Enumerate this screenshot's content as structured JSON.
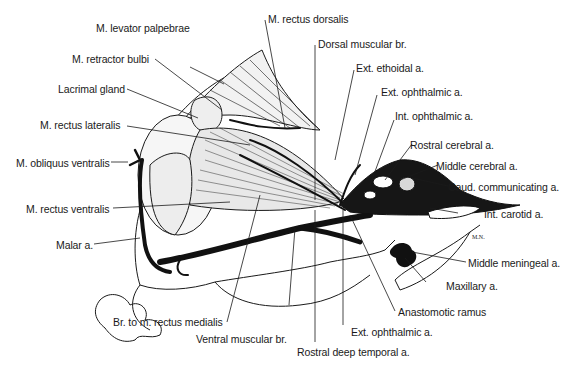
{
  "figure": {
    "signature": "M.N.",
    "labels": {
      "levator_palpebrae": "M. levator palpebrae",
      "retractor_bulbi": "M. retractor bulbi",
      "lacrimal_gland": "Lacrimal gland",
      "rectus_lateralis": "M. rectus lateralis",
      "obliquus_ventralis": "M. obliquus ventralis",
      "rectus_ventralis": "M. rectus ventralis",
      "malar_a": "Malar a.",
      "br_rectus_medialis": "Br. to m. rectus medialis",
      "ventral_muscular_br": "Ventral muscular br.",
      "rostral_deep_temporal_a": "Rostral deep temporal a.",
      "ext_ophthalmic_a_bottom": "Ext. ophthalmic a.",
      "anastomotic_ramus": "Anastomotic ramus",
      "maxillary_a": "Maxillary a.",
      "middle_meningeal_a": "Middle meningeal a.",
      "int_carotid_a": "Int. carotid a.",
      "caud_communicating_a": "Caud. communicating a.",
      "middle_cerebral_a": "Middle cerebral a.",
      "rostral_cerebral_a": "Rostral cerebral a.",
      "int_ophthalmic_a": "Int. ophthalmic a.",
      "ext_ophthalmic_a_top": "Ext. ophthalmic a.",
      "ext_ethoidal_a": "Ext. ethoidal a.",
      "dorsal_muscular_br": "Dorsal muscular br.",
      "rectus_dorsalis": "M. rectus dorsalis"
    },
    "colors": {
      "ink": "#1a1a1a",
      "paper": "#ffffff",
      "shade": "#e8e8e8"
    }
  }
}
